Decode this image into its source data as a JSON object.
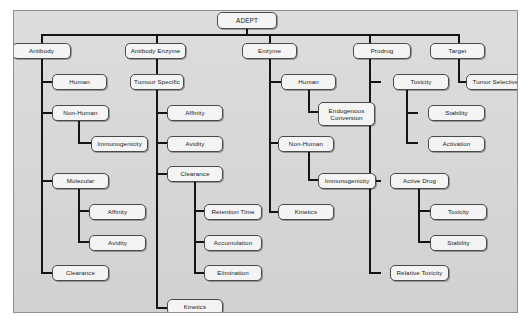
{
  "diagram": {
    "title": "ADEPT",
    "type": "hierarchy-tree",
    "root": "ADEPT",
    "branches": [
      "Antibody",
      "Antibody Enzyme",
      "Enzyme",
      "Prodrug",
      "Target"
    ]
  },
  "nodes": {
    "root": "ADEPT",
    "antibody": "Antibody",
    "antibody_human": "Human",
    "antibody_non_human": "Non-Human",
    "antibody_immunogenicity": "Immunogenicity",
    "antibody_molecular": "Molecular",
    "antibody_affinity": "Affinity",
    "antibody_avidity": "Avidity",
    "antibody_clearance": "Clearance",
    "ab_enzyme": "Antibody Enzyme",
    "ab_enzyme_tumour_specific": "Tumour Specific",
    "ab_enzyme_affinity": "Affinity",
    "ab_enzyme_avidity": "Avidity",
    "ab_enzyme_clearance": "Clearance",
    "ab_enzyme_retention_time": "Retention Time",
    "ab_enzyme_accumulation": "Accumulation",
    "ab_enzyme_elimination": "Elimination",
    "ab_enzyme_kinetics": "Kinetics",
    "enzyme": "Enzyme",
    "enzyme_human": "Human",
    "enzyme_endogenous_conversion": "Endogenous\nConversion",
    "enzyme_non_human": "Non-Human",
    "enzyme_immunogenicity": "Immunogenicity",
    "enzyme_kinetics": "Kinetics",
    "prodrug": "Prodrug",
    "prodrug_toxicity": "Toxicity",
    "prodrug_stability": "Stability",
    "prodrug_activation": "Activation",
    "prodrug_active_drug": "Active Drug",
    "prodrug_active_toxicity": "Toxicity",
    "prodrug_active_stability": "Stability",
    "prodrug_relative_toxicity": "Relative Toxicity",
    "target": "Target",
    "target_tumor_selective": "Tumor Selective"
  },
  "colors": {
    "panel_background": "#d9d9d9",
    "node_fill": "#f4f4f4",
    "node_border": "#4a4a4a",
    "edge": "#141414",
    "text": "#1a1a1a",
    "page_background": "#ffffff"
  }
}
